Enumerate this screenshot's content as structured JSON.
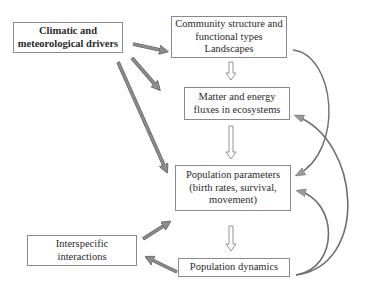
{
  "diagram": {
    "nodes": [
      {
        "id": "climatic",
        "label": "Climatic and\nmeteorological drivers",
        "bold": true
      },
      {
        "id": "community",
        "label": "Community structure and\nfunctional types\nLandscapes",
        "bold": false
      },
      {
        "id": "matter",
        "label": "Matter and energy\nfluxes in ecosystems",
        "bold": false
      },
      {
        "id": "popparams",
        "label": "Population parameters\n(birth rates, survival,\nmovement)",
        "bold": false
      },
      {
        "id": "interspecific",
        "label": "Interspecific\ninteractions",
        "bold": false
      },
      {
        "id": "popdyn",
        "label": "Population dynamics",
        "bold": false
      }
    ],
    "edges": [
      {
        "from": "climatic",
        "to": "community",
        "style": "thick-gray"
      },
      {
        "from": "climatic",
        "to": "matter",
        "style": "thick-gray"
      },
      {
        "from": "climatic",
        "to": "popparams",
        "style": "thick-gray"
      },
      {
        "from": "community",
        "to": "matter",
        "style": "hollow-down"
      },
      {
        "from": "matter",
        "to": "popparams",
        "style": "hollow-down"
      },
      {
        "from": "popparams",
        "to": "popdyn",
        "style": "hollow-down"
      },
      {
        "from": "interspecific",
        "to": "popparams",
        "style": "thick-gray"
      },
      {
        "from": "popdyn",
        "to": "interspecific",
        "style": "thick-gray"
      },
      {
        "from": "community",
        "to": "popparams",
        "style": "curved-feedback"
      },
      {
        "from": "popdyn",
        "to": "matter",
        "style": "curved-feedback"
      },
      {
        "from": "popdyn",
        "to": "popparams",
        "style": "curved-feedback"
      }
    ],
    "colors": {
      "arrow_fill": "#8c8c8c",
      "arrow_edge": "#5a5a5a",
      "box_border": "#8a8a8a",
      "text": "#2a2a2a"
    }
  }
}
